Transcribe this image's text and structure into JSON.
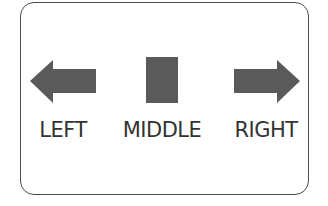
{
  "diagram": {
    "items": [
      {
        "id": "left",
        "label": "LEFT",
        "shape": "arrow-left-icon"
      },
      {
        "id": "middle",
        "label": "MIDDLE",
        "shape": "rectangle"
      },
      {
        "id": "right",
        "label": "RIGHT",
        "shape": "arrow-right-icon"
      }
    ],
    "colors": {
      "shape_fill": "#5a5a5a",
      "border": "#4a4a4a",
      "text": "#333333",
      "background": "#ffffff"
    }
  }
}
